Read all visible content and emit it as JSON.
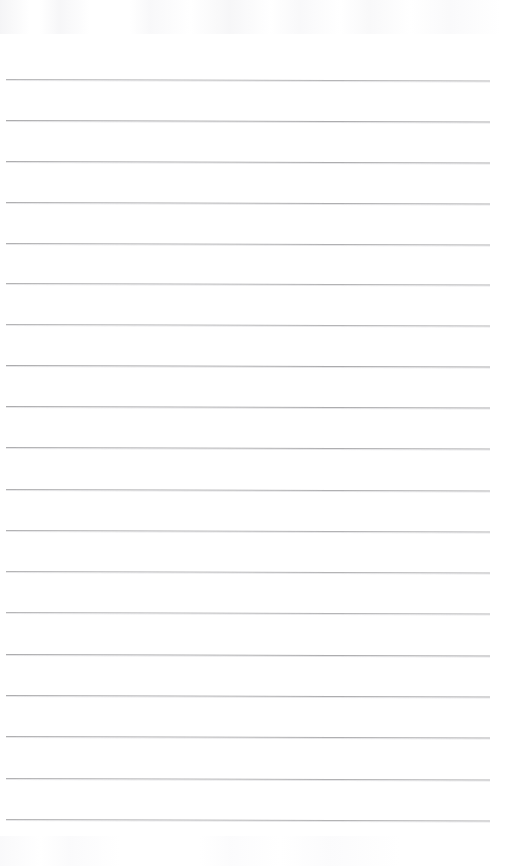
{
  "document": {
    "kind": "lined-notebook-page",
    "title": "Blank Lined Notebook Page",
    "content_text": "",
    "page_width": 524,
    "page_height": 866,
    "background_color": "#ffffff",
    "paper_tint": "#ffffff"
  },
  "ruling": {
    "line_color": "#a6a6a8",
    "line_thickness_px": 1,
    "line_spacing_px": 41,
    "left_margin_px": 6,
    "right_edge_px": 490,
    "line_width_px": 484,
    "first_line_y_px": 79,
    "last_line_y_px": 819,
    "line_count": 19,
    "slope_deg": 0.18,
    "line_y_positions": [
      79,
      120,
      161,
      202,
      243,
      283,
      324,
      365,
      406,
      447,
      489,
      530,
      571,
      612,
      654,
      695,
      736,
      778,
      819
    ]
  },
  "margins": {
    "has_vertical_margin_rule": false,
    "has_holes": false,
    "header_blank_height_px": 79,
    "footer_blank_height_px": 47
  },
  "annotations": {
    "handwriting_present": false,
    "printed_text_present": false,
    "watermark_present": false,
    "note": ""
  }
}
